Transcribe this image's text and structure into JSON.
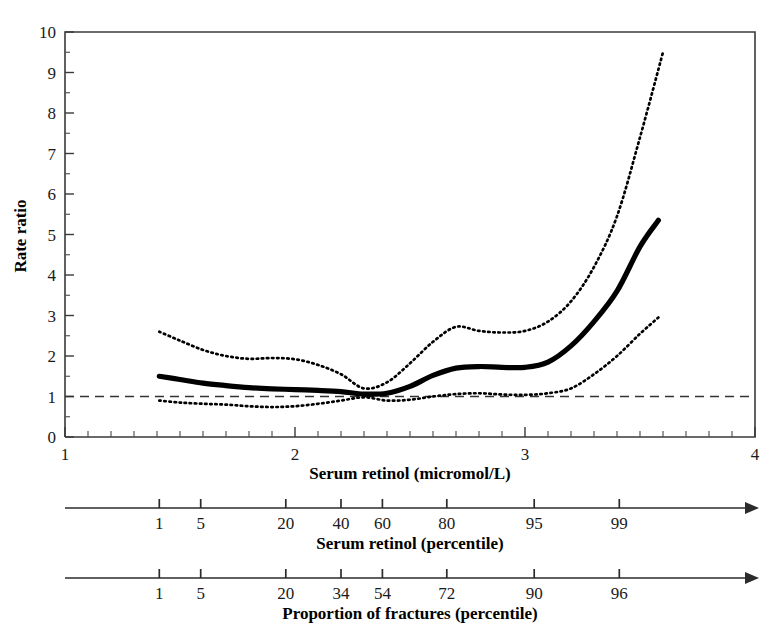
{
  "chart_data": {
    "type": "line",
    "title": "",
    "xlabel": "Serum retinol (micromol/L)",
    "ylabel": "Rate ratio",
    "xlim": [
      1,
      4
    ],
    "ylim": [
      0,
      10
    ],
    "grid": false,
    "legend": null,
    "x_ticks": [
      1,
      2,
      3,
      4
    ],
    "x_tick_labels": [
      "1",
      "2",
      "3",
      "4"
    ],
    "y_ticks": [
      0,
      1,
      2,
      3,
      4,
      5,
      6,
      7,
      8,
      9,
      10
    ],
    "y_tick_labels": [
      "0",
      "1",
      "2",
      "3",
      "4",
      "5",
      "6",
      "7",
      "8",
      "9",
      "10"
    ],
    "x_minor_step": 0.1,
    "y_minor_step": 0.5,
    "reference_line": {
      "y": 1,
      "style": "dashed"
    },
    "series": [
      {
        "name": "Rate ratio (fitted)",
        "style": "solid-thick",
        "x": [
          1.41,
          1.5,
          1.6,
          1.7,
          1.8,
          1.9,
          2.0,
          2.1,
          2.2,
          2.3,
          2.4,
          2.5,
          2.6,
          2.7,
          2.8,
          2.9,
          3.0,
          3.1,
          3.2,
          3.3,
          3.4,
          3.5,
          3.58
        ],
        "values": [
          1.5,
          1.42,
          1.33,
          1.27,
          1.22,
          1.19,
          1.17,
          1.15,
          1.12,
          1.06,
          1.08,
          1.25,
          1.52,
          1.7,
          1.74,
          1.72,
          1.72,
          1.85,
          2.25,
          2.85,
          3.6,
          4.7,
          5.35
        ]
      },
      {
        "name": "Upper 95% confidence limit",
        "style": "dotted",
        "x": [
          1.41,
          1.5,
          1.6,
          1.7,
          1.8,
          1.9,
          2.0,
          2.1,
          2.2,
          2.3,
          2.4,
          2.5,
          2.6,
          2.7,
          2.8,
          2.9,
          3.0,
          3.1,
          3.2,
          3.3,
          3.4,
          3.5,
          3.6
        ],
        "values": [
          2.6,
          2.38,
          2.15,
          2.0,
          1.93,
          1.95,
          1.92,
          1.78,
          1.55,
          1.2,
          1.35,
          1.82,
          2.35,
          2.72,
          2.62,
          2.58,
          2.62,
          2.85,
          3.35,
          4.2,
          5.45,
          7.4,
          9.5
        ]
      },
      {
        "name": "Lower 95% confidence limit",
        "style": "dotted",
        "x": [
          1.41,
          1.5,
          1.6,
          1.7,
          1.8,
          1.9,
          2.0,
          2.1,
          2.2,
          2.3,
          2.4,
          2.5,
          2.6,
          2.7,
          2.8,
          2.9,
          3.0,
          3.1,
          3.2,
          3.3,
          3.4,
          3.5,
          3.58
        ],
        "values": [
          0.9,
          0.85,
          0.82,
          0.8,
          0.76,
          0.74,
          0.76,
          0.82,
          0.9,
          0.98,
          0.9,
          0.92,
          1.0,
          1.06,
          1.08,
          1.05,
          1.04,
          1.08,
          1.2,
          1.55,
          2.0,
          2.55,
          2.95
        ]
      }
    ],
    "secondary_axes": [
      {
        "label": "Serum retinol (percentile)",
        "ticks": [
          1,
          5,
          20,
          40,
          60,
          80,
          95,
          99
        ],
        "tick_labels": [
          "1",
          "5",
          "20",
          "40",
          "60",
          "80",
          "95",
          "99"
        ],
        "tick_positions_x": [
          1.41,
          1.59,
          1.96,
          2.2,
          2.38,
          2.66,
          3.04,
          3.41
        ],
        "arrow_end": true
      },
      {
        "label": "Proportion of fractures (percentile)",
        "ticks": [
          1,
          5,
          20,
          34,
          54,
          72,
          90,
          96
        ],
        "tick_labels": [
          "1",
          "5",
          "20",
          "34",
          "54",
          "72",
          "90",
          "96"
        ],
        "tick_positions_x": [
          1.41,
          1.59,
          1.96,
          2.2,
          2.38,
          2.66,
          3.04,
          3.41
        ],
        "arrow_end": true
      }
    ],
    "colors": {
      "curve": "#000000",
      "confidence": "#000000",
      "reference": "#333333",
      "axis": "#3a3a3a",
      "background": "#ffffff"
    }
  }
}
